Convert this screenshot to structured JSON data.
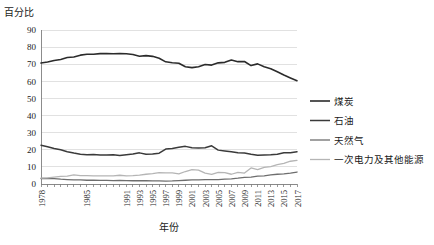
{
  "chart_data": {
    "type": "line",
    "title": "",
    "ylabel": "百分比",
    "xlabel": "年份",
    "ylim": [
      0,
      90
    ],
    "ytick_step": 10,
    "yticks": [
      0,
      10,
      20,
      30,
      40,
      50,
      60,
      70,
      80,
      90
    ],
    "grid": true,
    "legend_position": "right",
    "xtick_labels": [
      "1978",
      "1985",
      "1991",
      "1993",
      "1995",
      "1997",
      "1999",
      "2001",
      "2003",
      "2005",
      "2007",
      "2009",
      "2011",
      "2013",
      "2015",
      "2017"
    ],
    "x": [
      1978,
      1979,
      1980,
      1981,
      1982,
      1983,
      1984,
      1985,
      1986,
      1987,
      1988,
      1989,
      1990,
      1991,
      1992,
      1993,
      1994,
      1995,
      1996,
      1997,
      1998,
      1999,
      2000,
      2001,
      2002,
      2003,
      2004,
      2005,
      2006,
      2007,
      2008,
      2009,
      2010,
      2011,
      2012,
      2013,
      2014,
      2015,
      2016,
      2017
    ],
    "series": [
      {
        "name": "煤炭",
        "color": "#2b2b2b",
        "width": 1.6,
        "values": [
          70.7,
          71.3,
          72.2,
          72.8,
          73.9,
          74.2,
          75.3,
          75.8,
          75.8,
          76.2,
          76.2,
          76.1,
          76.2,
          76.1,
          75.7,
          74.7,
          75.0,
          74.6,
          73.5,
          71.4,
          70.9,
          70.6,
          68.5,
          68.0,
          68.5,
          69.8,
          69.5,
          70.8,
          71.1,
          72.5,
          71.5,
          71.6,
          69.2,
          70.2,
          68.5,
          67.4,
          65.6,
          63.7,
          62.0,
          60.4
        ]
      },
      {
        "name": "石油",
        "color": "#3a3a3a",
        "width": 1.5,
        "values": [
          22.7,
          21.8,
          20.7,
          20.0,
          18.9,
          18.1,
          17.4,
          17.1,
          17.2,
          17.0,
          17.0,
          17.1,
          16.6,
          17.1,
          17.5,
          18.2,
          17.4,
          17.5,
          18.0,
          20.4,
          20.8,
          21.5,
          22.0,
          21.2,
          21.0,
          21.2,
          22.3,
          19.8,
          19.3,
          18.8,
          18.3,
          18.1,
          17.4,
          16.8,
          17.0,
          17.1,
          17.4,
          18.3,
          18.3,
          18.8
        ]
      },
      {
        "name": "天然气",
        "color": "#6e6e6e",
        "width": 1.3,
        "values": [
          3.2,
          3.3,
          3.1,
          2.8,
          2.6,
          2.4,
          2.4,
          2.2,
          2.3,
          2.1,
          2.1,
          2.0,
          2.1,
          2.0,
          1.9,
          1.9,
          1.9,
          1.8,
          1.8,
          1.7,
          1.8,
          2.0,
          2.2,
          2.4,
          2.4,
          2.6,
          2.6,
          2.6,
          2.9,
          3.0,
          3.4,
          3.9,
          4.0,
          4.6,
          4.8,
          5.3,
          5.7,
          5.9,
          6.4,
          7.0
        ]
      },
      {
        "name": "一次电力及其他能源",
        "color": "#b5b5b5",
        "width": 1.3,
        "values": [
          3.4,
          3.6,
          4.0,
          4.4,
          4.6,
          5.3,
          4.9,
          4.9,
          4.7,
          4.7,
          4.7,
          4.8,
          5.1,
          4.8,
          4.9,
          5.2,
          5.7,
          6.1,
          6.7,
          6.5,
          6.5,
          5.9,
          7.3,
          8.4,
          8.1,
          6.4,
          5.6,
          6.8,
          6.7,
          5.7,
          6.8,
          6.4,
          9.4,
          8.4,
          9.7,
          10.2,
          11.3,
          12.1,
          13.3,
          13.8
        ]
      }
    ]
  }
}
